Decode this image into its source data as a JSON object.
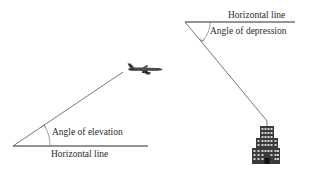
{
  "diagram": {
    "elevation": {
      "angle_label": "Angle of elevation",
      "horizontal_label": "Horizontal line",
      "observer_icon": "vertex-point",
      "target_icon": "airplane-icon"
    },
    "depression": {
      "angle_label": "Angle of depression",
      "horizontal_label": "Horizontal line",
      "observer_icon": "vertex-point",
      "target_icon": "building-icon"
    },
    "colors": {
      "line": "#2b2b2b",
      "sight_line": "#555555",
      "arc": "#666666",
      "building": "#3a3a3a"
    }
  }
}
